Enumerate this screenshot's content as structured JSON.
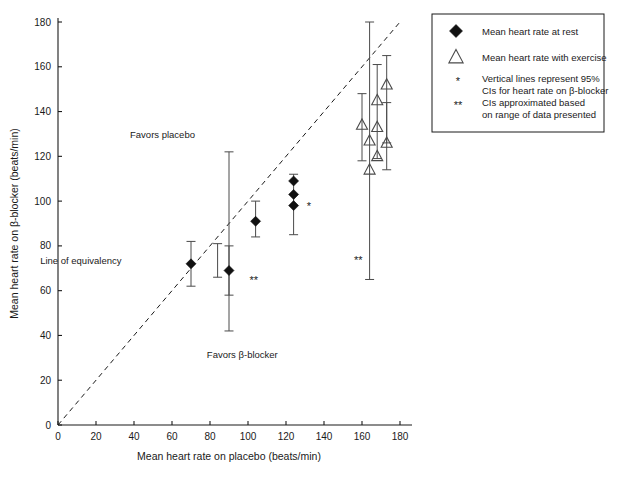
{
  "chart_data": {
    "type": "scatter",
    "title": "",
    "xlabel": "Mean heart rate on placebo (beats/min)",
    "ylabel": "Mean heart rate on β-blocker (beats/min)",
    "xlim": [
      0,
      180
    ],
    "ylim": [
      0,
      180
    ],
    "xticks": [
      0,
      20,
      40,
      60,
      80,
      100,
      120,
      140,
      160,
      180
    ],
    "yticks": [
      0,
      20,
      40,
      60,
      80,
      100,
      120,
      140,
      160,
      180
    ],
    "grid": false,
    "legend_position": "top-right",
    "reference_line": {
      "label": "Line of equivalency",
      "style": "dashed",
      "from": [
        0,
        0
      ],
      "to": [
        180,
        180
      ]
    },
    "annotations": [
      {
        "text": "Favors placebo",
        "x": 55,
        "y": 128
      },
      {
        "text": "Line of equivalency",
        "x": 12,
        "y": 72
      },
      {
        "text": "Favors β-blocker",
        "x": 97,
        "y": 30
      },
      {
        "text": "*",
        "x": 132,
        "y": 96
      },
      {
        "text": "**",
        "x": 103,
        "y": 63
      },
      {
        "text": "**",
        "x": 158,
        "y": 72
      }
    ],
    "series": [
      {
        "name": "Mean heart rate at rest",
        "marker": "filled-diamond",
        "points": [
          {
            "x": 70,
            "y": 72,
            "ci_low": 62,
            "ci_high": 82
          },
          {
            "x": 90,
            "y": 69,
            "ci_low": 58,
            "ci_high": 80
          },
          {
            "x": 104,
            "y": 91,
            "ci_low": 84,
            "ci_high": 100
          },
          {
            "x": 124,
            "y": 98,
            "ci_low": 85,
            "ci_high": 112
          },
          {
            "x": 124,
            "y": 103,
            "ci_low": 85,
            "ci_high": 112
          },
          {
            "x": 124,
            "y": 109,
            "ci_low": 85,
            "ci_high": 112
          }
        ]
      },
      {
        "name": "Mean heart rate with exercise",
        "marker": "open-triangle",
        "points": [
          {
            "x": 160,
            "y": 134,
            "ci_low": 118,
            "ci_high": 148
          },
          {
            "x": 164,
            "y": 127,
            "ci_low": 65,
            "ci_high": 180
          },
          {
            "x": 164,
            "y": 114,
            "ci_low": 65,
            "ci_high": 180
          },
          {
            "x": 168,
            "y": 145,
            "ci_low": 119,
            "ci_high": 161
          },
          {
            "x": 168,
            "y": 133,
            "ci_low": 119,
            "ci_high": 161
          },
          {
            "x": 168,
            "y": 120,
            "ci_low": 119,
            "ci_high": 161
          },
          {
            "x": 173,
            "y": 152,
            "ci_low": 126,
            "ci_high": 165
          },
          {
            "x": 173,
            "y": 126,
            "ci_low": 114,
            "ci_high": 144
          }
        ]
      }
    ],
    "error_bars_only": [
      {
        "x": 84,
        "y_low": 66,
        "y_high": 81
      },
      {
        "x": 90,
        "y_low": 42,
        "y_high": 122
      }
    ]
  },
  "legend": {
    "items": [
      {
        "marker": "filled-diamond",
        "label": "Mean heart rate at rest"
      },
      {
        "marker": "open-triangle",
        "label": "Mean heart rate with exercise"
      },
      {
        "marker": "*",
        "label_line1": "Vertical lines represent 95%",
        "label_line2": "CIs for heart rate on  β-blocker"
      },
      {
        "marker": "**",
        "label_line1": "CIs approximated based",
        "label_line2": "on range of data presented"
      }
    ]
  },
  "colors": {
    "axis": "#1a1a1a",
    "marker_fill": "#111111",
    "error_bar": "#4a4a4a",
    "background": "#ffffff"
  }
}
